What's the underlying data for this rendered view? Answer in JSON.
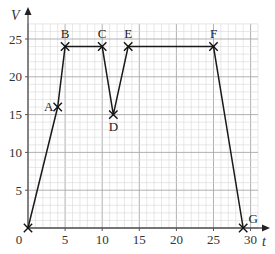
{
  "chart_data": {
    "type": "line",
    "title": "",
    "xlabel": "t",
    "ylabel": "V",
    "xlim": [
      0,
      31
    ],
    "ylim": [
      0,
      27
    ],
    "grid": true,
    "x_ticks": [
      0,
      5,
      10,
      15,
      20,
      25,
      30
    ],
    "y_ticks": [
      5,
      10,
      15,
      20,
      25
    ],
    "x_tick_labels": [
      "0",
      "5",
      "10",
      "15",
      "20",
      "25",
      "30"
    ],
    "y_tick_labels": [
      "5",
      "10",
      "15",
      "20",
      "25"
    ],
    "points": [
      {
        "label": "",
        "t": 0,
        "V": 0
      },
      {
        "label": "A",
        "t": 4,
        "V": 16
      },
      {
        "label": "B",
        "t": 5,
        "V": 24
      },
      {
        "label": "C",
        "t": 10,
        "V": 24
      },
      {
        "label": "D",
        "t": 11.5,
        "V": 15
      },
      {
        "label": "E",
        "t": 13.5,
        "V": 24
      },
      {
        "label": "F",
        "t": 25,
        "V": 24
      },
      {
        "label": "G",
        "t": 29,
        "V": 0
      }
    ],
    "x": [
      0,
      4,
      5,
      10,
      11.5,
      13.5,
      25,
      29
    ],
    "series": [
      {
        "name": "V",
        "values": [
          0,
          16,
          24,
          24,
          15,
          24,
          24,
          0
        ]
      }
    ],
    "annotations": [
      "A",
      "B",
      "C",
      "D",
      "E",
      "F",
      "G"
    ],
    "colors": {
      "line": "#1a1a1a",
      "grid_minor": "#d8d8d8",
      "grid_major": "#a8a8a8",
      "axis": "#555555"
    }
  }
}
